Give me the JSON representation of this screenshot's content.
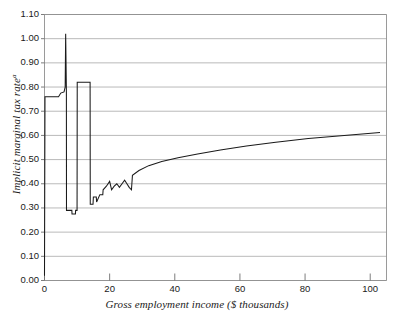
{
  "chart_data": {
    "type": "line",
    "title": "",
    "xlabel": "Gross employment income ($ thousands)",
    "ylabel": "Implicit marginal tax rate",
    "ylabel_footnote": "a",
    "xlim": [
      0,
      105
    ],
    "ylim": [
      0.0,
      1.1
    ],
    "grid": true,
    "legend": "none",
    "xticks": [
      0,
      20,
      40,
      60,
      80,
      100
    ],
    "xtick_labels": [
      "0",
      "20",
      "40",
      "60",
      "80",
      "100"
    ],
    "yticks": [
      0.0,
      0.1,
      0.2,
      0.3,
      0.4,
      0.5,
      0.6,
      0.7,
      0.8,
      0.9,
      1.0,
      1.1
    ],
    "ytick_labels": [
      "0.00",
      "0.10",
      "0.20",
      "0.30",
      "0.40",
      "0.50",
      "0.60",
      "0.70",
      "0.80",
      "0.90",
      "1.00",
      "1.10"
    ],
    "series": [
      {
        "name": "Implicit marginal tax rate",
        "color": "#1a1a1a",
        "points": [
          [
            0.0,
            0.02
          ],
          [
            0.15,
            0.76
          ],
          [
            4.3,
            0.76
          ],
          [
            5.0,
            0.775
          ],
          [
            6.0,
            0.78
          ],
          [
            6.35,
            0.8
          ],
          [
            6.5,
            1.02
          ],
          [
            6.72,
            0.78
          ],
          [
            6.75,
            0.29
          ],
          [
            8.4,
            0.29
          ],
          [
            8.45,
            0.275
          ],
          [
            9.5,
            0.275
          ],
          [
            9.55,
            0.29
          ],
          [
            10.0,
            0.29
          ],
          [
            10.05,
            0.82
          ],
          [
            14.0,
            0.82
          ],
          [
            14.05,
            0.315
          ],
          [
            14.9,
            0.315
          ],
          [
            15.0,
            0.345
          ],
          [
            15.9,
            0.345
          ],
          [
            16.0,
            0.325
          ],
          [
            17.0,
            0.355
          ],
          [
            17.9,
            0.355
          ],
          [
            18.0,
            0.375
          ],
          [
            19.0,
            0.39
          ],
          [
            20.0,
            0.41
          ],
          [
            20.6,
            0.375
          ],
          [
            21.4,
            0.39
          ],
          [
            22.2,
            0.4
          ],
          [
            23.0,
            0.385
          ],
          [
            23.8,
            0.4
          ],
          [
            24.6,
            0.415
          ],
          [
            25.3,
            0.4
          ],
          [
            26.0,
            0.385
          ],
          [
            26.7,
            0.375
          ],
          [
            27.0,
            0.435
          ],
          [
            29.0,
            0.455
          ],
          [
            32.0,
            0.475
          ],
          [
            36.0,
            0.492
          ],
          [
            41.0,
            0.508
          ],
          [
            47.0,
            0.523
          ],
          [
            54.0,
            0.54
          ],
          [
            62.0,
            0.556
          ],
          [
            71.0,
            0.572
          ],
          [
            81.0,
            0.587
          ],
          [
            92.0,
            0.6
          ],
          [
            103.0,
            0.612
          ]
        ]
      }
    ]
  },
  "axes": {
    "gridline_color": "#a8a8a8",
    "frame_color": "#8f8f8f",
    "tick_color": "#6e6e6e"
  }
}
